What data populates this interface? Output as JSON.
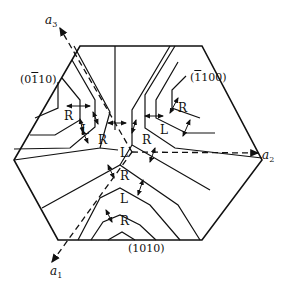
{
  "diagram": {
    "type": "crystallographic hexagon domain diagram",
    "axes": {
      "a1": {
        "label": "a",
        "sub": "1"
      },
      "a2": {
        "label": "a",
        "sub": "2"
      },
      "a3": {
        "label": "a",
        "sub": "3"
      }
    },
    "planes": {
      "left": {
        "open": "(0",
        "bar": "1",
        "rest": "10)"
      },
      "right": {
        "open": "(",
        "bar": "1",
        "rest": "100)"
      },
      "bottom": {
        "text": "(1010)"
      }
    },
    "domains": {
      "top_left_R": "R",
      "top_left_L": "L",
      "top_left_R2": "R",
      "top_right_R": "R",
      "top_right_L": "L",
      "top_right_R2": "R",
      "center_L": "L",
      "bottom_R1": "R",
      "bottom_L": "L",
      "bottom_R2": "R"
    },
    "colors": {
      "line": "#111111",
      "background": "#ffffff"
    }
  }
}
